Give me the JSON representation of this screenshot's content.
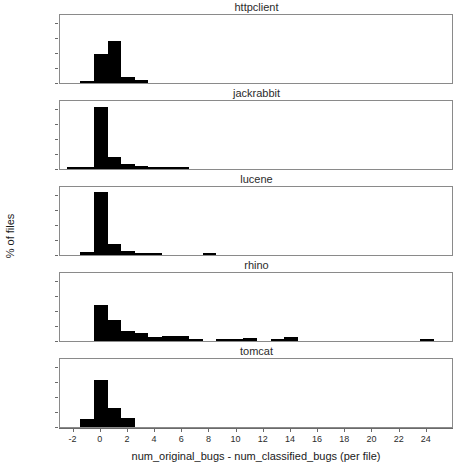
{
  "chart_data": {
    "type": "bar",
    "title": "",
    "xlabel": "num_original_bugs - num_classified_bugs (per file)",
    "ylabel": "% of files",
    "grid": false,
    "legend": "none",
    "xlim": [
      -3,
      26
    ],
    "ylim": [
      0,
      90
    ],
    "xticks": [
      -2,
      0,
      2,
      4,
      6,
      8,
      10,
      12,
      14,
      16,
      18,
      20,
      22,
      24
    ],
    "xtick_labels": [
      "-2",
      "0",
      "2",
      "4",
      "6",
      "8",
      "10",
      "12",
      "14",
      "16",
      "18",
      "20",
      "22",
      "24"
    ],
    "yticks": [
      0,
      20,
      40,
      60,
      80
    ],
    "ytick_labels": [
      "0%",
      "20%",
      "40%",
      "60%",
      "80%"
    ],
    "bar_width": 1,
    "panels": [
      {
        "name": "httpclient",
        "x": [
          -1,
          0,
          1,
          2,
          3
        ],
        "values": [
          3,
          38,
          56,
          8,
          4
        ]
      },
      {
        "name": "jackrabbit",
        "x": [
          -2,
          -1,
          0,
          1,
          2,
          3,
          4,
          5,
          6
        ],
        "values": [
          1.5,
          2.5,
          82,
          16,
          7,
          4,
          2,
          1.5,
          2
        ]
      },
      {
        "name": "lucene",
        "x": [
          -1,
          0,
          1,
          2,
          3,
          4,
          8
        ],
        "values": [
          4,
          83,
          15,
          5.5,
          2,
          2.5,
          1.5
        ]
      },
      {
        "name": "rhino",
        "x": [
          0,
          1,
          2,
          3,
          4,
          5,
          6,
          7,
          9,
          10,
          11,
          13,
          14,
          24
        ],
        "values": [
          48,
          28,
          13,
          10,
          5,
          6,
          6,
          3,
          3,
          3,
          4.5,
          3,
          5.5,
          3
        ]
      },
      {
        "name": "tomcat",
        "x": [
          -1,
          0,
          1,
          2
        ],
        "values": [
          11,
          62,
          25,
          12
        ]
      }
    ]
  },
  "figure": {
    "ylabel": "% of files",
    "xlabel": "num_original_bugs - num_classified_bugs (per file)",
    "panel_titles": [
      "httpclient",
      "jackrabbit",
      "lucene",
      "rhino",
      "tomcat"
    ],
    "ytick_labels": [
      "0%",
      "20%",
      "40%",
      "60%",
      "80%"
    ],
    "xtick_labels": [
      "-2",
      "0",
      "2",
      "4",
      "6",
      "8",
      "10",
      "12",
      "14",
      "16",
      "18",
      "20",
      "22",
      "24"
    ],
    "colors": {
      "bar": "#000000",
      "frame": "#8a8a8a",
      "text": "#1a1a1a",
      "background": "#ffffff"
    }
  }
}
